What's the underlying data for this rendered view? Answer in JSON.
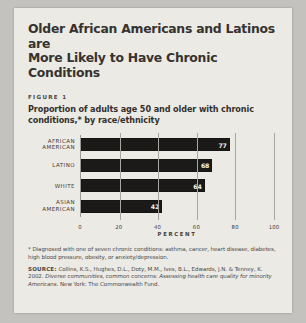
{
  "document": {
    "headline_line1": "Older African Americans and Latinos are",
    "headline_line2": "More Likely to Have Chronic Conditions",
    "figure_label": "FIGURE 1",
    "subtitle_line1": "Proportion of adults age 50 and older with chronic",
    "subtitle_line2": "conditions,* by race/ethnicity"
  },
  "chart_data": {
    "type": "bar",
    "orientation": "horizontal",
    "title": "Proportion of adults age 50 and older with chronic conditions,* by race/ethnicity",
    "categories": [
      "AFRICAN AMERICAN",
      "LATINO",
      "WHITE",
      "ASIAN AMERICAN"
    ],
    "values": [
      77,
      68,
      64,
      42
    ],
    "xlabel": "PERCENT",
    "ylabel": "",
    "xlim": [
      0,
      100
    ],
    "xticks": [
      0,
      20,
      40,
      60,
      80,
      100
    ],
    "xtick_labels": [
      "0",
      "20",
      "40",
      "60",
      "80",
      "100"
    ],
    "grid": true,
    "legend": false,
    "bar_color": "#1b1a19",
    "value_label_color": "#f2f1ee"
  },
  "notes": {
    "footnote": "* Diagnosed with one of seven chronic conditions: asthma, cancer, heart disease, diabetes, high blood pressure, obesity, or anxiety/depression.",
    "source_tag": "SOURCE:",
    "source_authors": "Collins, K.S., Hughes, D.L., Doty, M.M., Ives, B.L., Edwards, J.N. & Tenney, K. 2002.",
    "source_title": "Diverse communities, common concerns: Assessing health care quality for minority Americans.",
    "source_publisher": "New York: The Commonwealth Fund."
  },
  "colors": {
    "page": "#eceae5",
    "scan_background": "#c3c2be",
    "ink": "#35322f",
    "bar": "#1b1a19",
    "gridline": "#a9a6a1"
  }
}
